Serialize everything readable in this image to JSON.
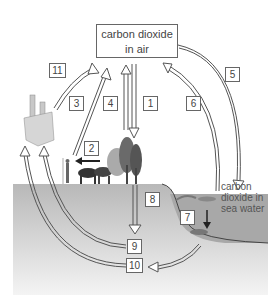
{
  "diagram": {
    "title_box": {
      "line1": "carbon dioxide",
      "line2": "in air"
    },
    "sea_label": {
      "line1": "carbon",
      "line2": "dioxide in",
      "line3": "sea water"
    },
    "numbers": [
      {
        "id": "1",
        "label": "1"
      },
      {
        "id": "2",
        "label": "2"
      },
      {
        "id": "3",
        "label": "3"
      },
      {
        "id": "4",
        "label": "4"
      },
      {
        "id": "5",
        "label": "5"
      },
      {
        "id": "6",
        "label": "6"
      },
      {
        "id": "7",
        "label": "7"
      },
      {
        "id": "8",
        "label": "8"
      },
      {
        "id": "9",
        "label": "9"
      },
      {
        "id": "10",
        "label": "10"
      },
      {
        "id": "11",
        "label": "11"
      }
    ],
    "colors": {
      "ground": "#bdbdbd",
      "sea": "#a9a9a9",
      "border": "#666666",
      "text": "#444444"
    }
  }
}
